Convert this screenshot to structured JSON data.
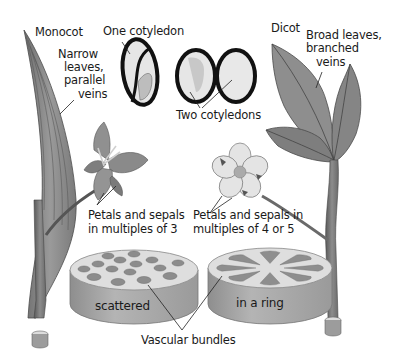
{
  "diagram": {
    "colors": {
      "background": "#ffffff",
      "text": "#1a1a1a",
      "leaf_fill": "#8a8a8a",
      "leaf_dark": "#5e5e5e",
      "flower_light": "#e2e2e2",
      "seed_outline": "#111111",
      "seed_fill": "#e6e6e6",
      "stem_top": "#dcdcdc",
      "stem_side": "#a4a4a4",
      "bundle": "#8c8c8c"
    },
    "monocot": {
      "heading": "Monocot",
      "leaf_label": [
        "Narrow",
        "leaves,",
        "parallel",
        "veins"
      ],
      "seed_label": "One cotyledon",
      "flower_label": [
        "Petals and sepals",
        "in multiples of 3"
      ],
      "stem_label": "scattered"
    },
    "dicot": {
      "heading": "Dicot",
      "leaf_label": [
        "Broad leaves,",
        "branched",
        "veins"
      ],
      "seed_label": "Two cotyledons",
      "flower_label": [
        "Petals and sepals in",
        "multiples of 4 or 5"
      ],
      "stem_label": "in a ring"
    },
    "shared": {
      "vascular_label": "Vascular bundles"
    }
  }
}
